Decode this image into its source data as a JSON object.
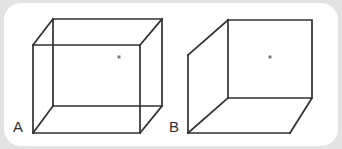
{
  "canvas": {
    "width": 342,
    "height": 149,
    "background_color": "#e3e3e3",
    "card_color": "#ffffff",
    "card_radius": 17
  },
  "style": {
    "line_color": "#2f3033",
    "line_width": 1.7,
    "dot_color": "#7b7b7b",
    "label_color": "#2f3033"
  },
  "figure": {
    "title": "",
    "cubes": [
      {
        "id": "cube-a",
        "label": "A",
        "label_position": {
          "x": 13,
          "y": 119
        },
        "drawing_style": "wireframe-all-edges-visible",
        "vertices": {
          "front_top_left": {
            "x": 33,
            "y": 45
          },
          "front_top_right": {
            "x": 140,
            "y": 45
          },
          "front_bottom_right": {
            "x": 140,
            "y": 133
          },
          "front_bottom_left": {
            "x": 33,
            "y": 133
          },
          "back_top_left": {
            "x": 53,
            "y": 19
          },
          "back_top_right": {
            "x": 162,
            "y": 19
          },
          "back_bottom_right": {
            "x": 162,
            "y": 106
          },
          "back_bottom_left": {
            "x": 53,
            "y": 106
          }
        },
        "dot": {
          "x": 119,
          "y": 57,
          "size": 3
        }
      },
      {
        "id": "cube-b",
        "label": "B",
        "label_position": {
          "x": 169,
          "y": 119
        },
        "drawing_style": "opaque-hidden-edges-removed",
        "vertices": {
          "front_top_left": {
            "x": 228,
            "y": 20
          },
          "front_top_right": {
            "x": 312,
            "y": 20
          },
          "front_bottom_right": {
            "x": 312,
            "y": 98
          },
          "front_bottom_left": {
            "x": 228,
            "y": 98
          },
          "side_top_left": {
            "x": 188,
            "y": 55
          },
          "side_bottom_left": {
            "x": 188,
            "y": 133
          },
          "bottom_front_right": {
            "x": 290,
            "y": 133
          }
        },
        "dot": {
          "x": 270,
          "y": 57,
          "size": 3
        }
      }
    ]
  }
}
